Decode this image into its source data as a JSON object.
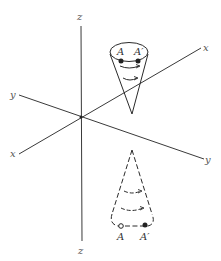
{
  "figure": {
    "axes": {
      "z_top_label": "z",
      "z_bottom_label": "z",
      "x_right_label": "x",
      "x_left_label": "x",
      "y_left_label": "y",
      "y_right_label": "y"
    },
    "upper_cone": {
      "point_a_label": "A",
      "point_a_prime_label": "A′"
    },
    "lower_cone": {
      "point_a_label": "A",
      "point_a_prime_label": "A′"
    },
    "colors": {
      "line": "#333333",
      "label": "#555555",
      "background": "#ffffff"
    }
  }
}
